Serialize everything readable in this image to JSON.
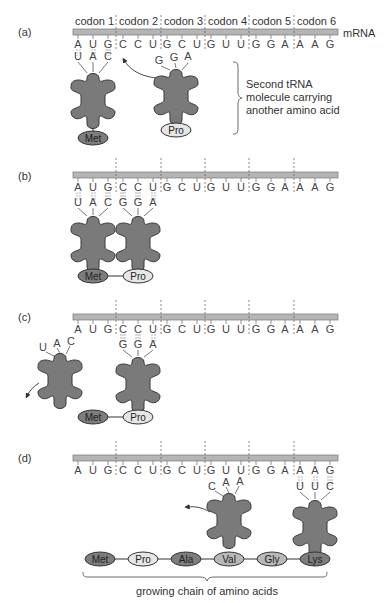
{
  "figure": {
    "mrna_label": "mRNA",
    "codon_labels": [
      "codon 1",
      "codon 2",
      "codon 3",
      "codon 4",
      "codon 5",
      "codon 6"
    ],
    "mrna_sequence": [
      "A",
      "U",
      "G",
      "C",
      "C",
      "U",
      "G",
      "C",
      "U",
      "G",
      "U",
      "U",
      "G",
      "G",
      "A",
      "A",
      "A",
      "G"
    ],
    "colors": {
      "trna_fill": "#7a7a7a",
      "trna_stroke": "#3a3a3a",
      "mrna_bar": "#b5b5b5",
      "aa_dark": "#7d7d7d",
      "aa_light": "#e6e6e6",
      "aa_mid": "#b8b8b8",
      "divider": "#555555"
    },
    "panels": [
      {
        "id": "a",
        "label": "(a)",
        "trnas": [
          {
            "anticodon": [
              "U",
              "A",
              "C"
            ],
            "amino_acid": "Met",
            "aa_shade": "dark",
            "bound": true
          },
          {
            "anticodon": [
              "G",
              "G",
              "A"
            ],
            "amino_acid": "Pro",
            "aa_shade": "light",
            "bound": false
          }
        ],
        "annotation": [
          "Second tRNA",
          "molecule carrying",
          "another amino acid"
        ]
      },
      {
        "id": "b",
        "label": "(b)",
        "trnas": [
          {
            "anticodon": [
              "U",
              "A",
              "C"
            ],
            "amino_acid": "Met",
            "aa_shade": "dark",
            "bound": true
          },
          {
            "anticodon": [
              "G",
              "G",
              "A"
            ],
            "amino_acid": "Pro",
            "aa_shade": "light",
            "bound": true
          }
        ],
        "chain": [
          "Met",
          "Pro"
        ]
      },
      {
        "id": "c",
        "label": "(c)",
        "trnas": [
          {
            "anticodon": [
              "U",
              "A",
              "C"
            ],
            "amino_acid": null,
            "bound": false,
            "leaving": true
          },
          {
            "anticodon": [
              "G",
              "G",
              "A"
            ],
            "amino_acid": "Pro",
            "aa_shade": "light",
            "bound": true
          }
        ],
        "chain": [
          "Met",
          "Pro"
        ]
      },
      {
        "id": "d",
        "label": "(d)",
        "trnas": [
          {
            "anticodon": [
              "C",
              "A",
              "A"
            ],
            "amino_acid": null,
            "bound": false,
            "leaving": true
          },
          {
            "anticodon": [
              "U",
              "U",
              "C"
            ],
            "amino_acid": "Lys",
            "aa_shade": "dark",
            "bound": true
          }
        ],
        "chain": [
          {
            "name": "Met",
            "shade": "dark"
          },
          {
            "name": "Pro",
            "shade": "light"
          },
          {
            "name": "Ala",
            "shade": "dark"
          },
          {
            "name": "Val",
            "shade": "mid"
          },
          {
            "name": "Gly",
            "shade": "mid"
          },
          {
            "name": "Lys",
            "shade": "dark"
          }
        ],
        "chain_caption": "growing chain of amino acids"
      }
    ]
  }
}
